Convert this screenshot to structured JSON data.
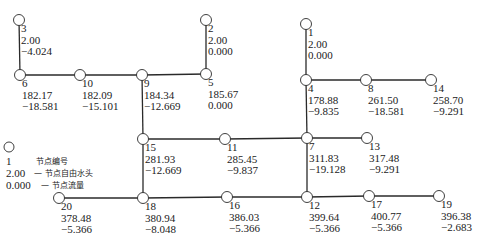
{
  "diagram": {
    "type": "pipe-network",
    "nodes": [
      {
        "id": "1",
        "x": 306,
        "y": 24,
        "head": "2.00",
        "flow": "0.000"
      },
      {
        "id": "2",
        "x": 206,
        "y": 20,
        "head": "2.00",
        "flow": "0.000"
      },
      {
        "id": "3",
        "x": 19,
        "y": 20,
        "head": "2.00",
        "flow": "-4.024"
      },
      {
        "id": "4",
        "x": 306,
        "y": 80,
        "head": "178.88",
        "flow": "-9.835"
      },
      {
        "id": "5",
        "x": 206,
        "y": 74,
        "head": "185.67",
        "flow": "0.000"
      },
      {
        "id": "6",
        "x": 20,
        "y": 75,
        "head": "182.17",
        "flow": "-18.581"
      },
      {
        "id": "7",
        "x": 307,
        "y": 138,
        "head": "311.83",
        "flow": "-19.128"
      },
      {
        "id": "8",
        "x": 366,
        "y": 80,
        "head": "261.50",
        "flow": "-18.581"
      },
      {
        "id": "9",
        "x": 142,
        "y": 75,
        "head": "184.34",
        "flow": "-12.669"
      },
      {
        "id": "10",
        "x": 80,
        "y": 75,
        "head": "182.09",
        "flow": "-15.101"
      },
      {
        "id": "11",
        "x": 225,
        "y": 139,
        "head": "285.45",
        "flow": "-9.837"
      },
      {
        "id": "12",
        "x": 307,
        "y": 197,
        "head": "399.64",
        "flow": "-5.366"
      },
      {
        "id": "13",
        "x": 367,
        "y": 138,
        "head": "317.48",
        "flow": "-9.291"
      },
      {
        "id": "14",
        "x": 431,
        "y": 80,
        "head": "258.70",
        "flow": "-9.291"
      },
      {
        "id": "15",
        "x": 143,
        "y": 139,
        "head": "281.93",
        "flow": "-12.669"
      },
      {
        "id": "16",
        "x": 227,
        "y": 197,
        "head": "386.03",
        "flow": "-5.366"
      },
      {
        "id": "17",
        "x": 369,
        "y": 196,
        "head": "400.77",
        "flow": "-5.366"
      },
      {
        "id": "18",
        "x": 143,
        "y": 198,
        "head": "380.94",
        "flow": "-8.048"
      },
      {
        "id": "19",
        "x": 439,
        "y": 196,
        "head": "396.38",
        "flow": "-2.683"
      },
      {
        "id": "20",
        "x": 59,
        "y": 198,
        "head": "378.48",
        "flow": "-5.366"
      }
    ],
    "pipes": [
      [
        "3",
        "6"
      ],
      [
        "6",
        "10"
      ],
      [
        "10",
        "9"
      ],
      [
        "9",
        "5"
      ],
      [
        "5",
        "2"
      ],
      [
        "1",
        "4"
      ],
      [
        "4",
        "8"
      ],
      [
        "8",
        "14"
      ],
      [
        "4",
        "7"
      ],
      [
        "9",
        "15"
      ],
      [
        "15",
        "11"
      ],
      [
        "11",
        "7"
      ],
      [
        "7",
        "13"
      ],
      [
        "15",
        "18"
      ],
      [
        "7",
        "12"
      ],
      [
        "20",
        "18"
      ],
      [
        "18",
        "16"
      ],
      [
        "16",
        "12"
      ],
      [
        "12",
        "17"
      ],
      [
        "17",
        "19"
      ]
    ]
  },
  "legend": {
    "node_id_example": "1",
    "node_id_desc": "节点编号",
    "head_example": "2.00",
    "head_desc": "— 节点自由水头",
    "flow_example": "0.000",
    "flow_desc": "— 节点流量"
  }
}
